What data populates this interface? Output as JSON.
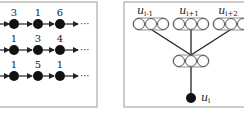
{
  "figure": {
    "left_panel": {
      "rows": [
        {
          "values": [
            "3",
            "1",
            "6"
          ],
          "trailing": "···"
        },
        {
          "values": [
            "1",
            "3",
            "4"
          ],
          "trailing": "···"
        },
        {
          "values": [
            "1",
            "5",
            "1"
          ],
          "trailing": "···"
        }
      ]
    },
    "right_panel": {
      "input_groups": [
        {
          "label": "u",
          "subscript": "i-1"
        },
        {
          "label": "u",
          "subscript": "i+1"
        },
        {
          "label": "u",
          "subscript": "i+2"
        }
      ],
      "output_node": {
        "label": "u",
        "subscript": "i"
      }
    },
    "colors": {
      "node_fill": "#111111",
      "line": "#222222",
      "border": "#999999",
      "background": "#ffffff"
    }
  }
}
